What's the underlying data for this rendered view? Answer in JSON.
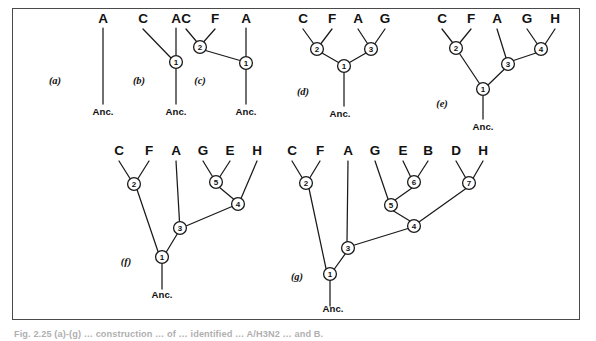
{
  "figure": {
    "kind": "phylogenetic-tree-series",
    "panel_count": 7,
    "frame_color": "#4a4a4a",
    "line_color": "#1a1a1a",
    "background": "#ffffff",
    "ancestor_label": "Anc."
  },
  "caption": {
    "text": "Fig. 2.25 (a)-(g) …  construction … of … identified … A/H3N2 … and B."
  },
  "panels": [
    {
      "id": "a",
      "label": "(a)",
      "label_x": 55,
      "label_y": 84,
      "anc": {
        "text": "Anc.",
        "x": 103,
        "y": 115
      },
      "taxa": [
        {
          "name": "A",
          "x": 103,
          "y": 23
        }
      ],
      "nodes": [],
      "branches": [
        {
          "x1": 103,
          "y1": 28,
          "x2": 103,
          "y2": 104
        }
      ]
    },
    {
      "id": "b",
      "label": "(b)",
      "label_x": 139,
      "label_y": 84,
      "anc": {
        "text": "Anc.",
        "x": 176,
        "y": 115
      },
      "taxa": [
        {
          "name": "C",
          "x": 143,
          "y": 23
        },
        {
          "name": "A",
          "x": 176,
          "y": 23
        }
      ],
      "nodes": [
        {
          "num": "1",
          "x": 176,
          "y": 62,
          "r": 6.4
        }
      ],
      "branches": [
        {
          "x1": 176,
          "y1": 28,
          "x2": 176,
          "y2": 55.6
        },
        {
          "x1": 143,
          "y1": 29,
          "x2": 171.5,
          "y2": 58.5
        },
        {
          "x1": 176,
          "y1": 68.4,
          "x2": 176,
          "y2": 104
        }
      ]
    },
    {
      "id": "c",
      "label": "(c)",
      "label_x": 200,
      "label_y": 84,
      "anc": {
        "text": "Anc.",
        "x": 246,
        "y": 115
      },
      "taxa": [
        {
          "name": "C",
          "x": 186,
          "y": 23
        },
        {
          "name": "F",
          "x": 215,
          "y": 23
        },
        {
          "name": "A",
          "x": 246,
          "y": 23
        }
      ],
      "nodes": [
        {
          "num": "2",
          "x": 200,
          "y": 47,
          "r": 6.4
        },
        {
          "num": "1",
          "x": 246,
          "y": 63,
          "r": 6.4
        }
      ],
      "branches": [
        {
          "x1": 186,
          "y1": 29,
          "x2": 196.5,
          "y2": 41.5
        },
        {
          "x1": 215,
          "y1": 29,
          "x2": 204,
          "y2": 41.5
        },
        {
          "x1": 205.5,
          "y1": 50.5,
          "x2": 240,
          "y2": 60.5
        },
        {
          "x1": 246,
          "y1": 28,
          "x2": 246,
          "y2": 56.6
        },
        {
          "x1": 246,
          "y1": 69.4,
          "x2": 246,
          "y2": 104
        }
      ]
    },
    {
      "id": "d",
      "label": "(d)",
      "label_x": 303,
      "label_y": 95,
      "anc": {
        "text": "Anc.",
        "x": 340,
        "y": 117
      },
      "taxa": [
        {
          "name": "C",
          "x": 303,
          "y": 23
        },
        {
          "name": "F",
          "x": 332,
          "y": 23
        },
        {
          "name": "A",
          "x": 358,
          "y": 23
        },
        {
          "name": "G",
          "x": 385,
          "y": 23
        }
      ],
      "nodes": [
        {
          "num": "2",
          "x": 317,
          "y": 49,
          "r": 6.4
        },
        {
          "num": "3",
          "x": 371,
          "y": 49,
          "r": 6.4
        },
        {
          "num": "1",
          "x": 344,
          "y": 66,
          "r": 6.4
        }
      ],
      "branches": [
        {
          "x1": 303,
          "y1": 29,
          "x2": 313.5,
          "y2": 43.5
        },
        {
          "x1": 332,
          "y1": 29,
          "x2": 321,
          "y2": 43.5
        },
        {
          "x1": 358,
          "y1": 29,
          "x2": 367.5,
          "y2": 43.5
        },
        {
          "x1": 385,
          "y1": 29,
          "x2": 375,
          "y2": 43.5
        },
        {
          "x1": 322,
          "y1": 53,
          "x2": 338.5,
          "y2": 62.5
        },
        {
          "x1": 366,
          "y1": 53,
          "x2": 349.5,
          "y2": 62.5
        },
        {
          "x1": 344,
          "y1": 72.4,
          "x2": 344,
          "y2": 106
        }
      ]
    },
    {
      "id": "e",
      "label": "(e)",
      "label_x": 442,
      "label_y": 107,
      "anc": {
        "text": "Anc.",
        "x": 483,
        "y": 130
      },
      "taxa": [
        {
          "name": "C",
          "x": 442,
          "y": 23
        },
        {
          "name": "F",
          "x": 471,
          "y": 23
        },
        {
          "name": "A",
          "x": 497,
          "y": 23
        },
        {
          "name": "G",
          "x": 527,
          "y": 23
        },
        {
          "name": "H",
          "x": 555,
          "y": 23
        }
      ],
      "nodes": [
        {
          "num": "2",
          "x": 456,
          "y": 48,
          "r": 6.4
        },
        {
          "num": "4",
          "x": 541,
          "y": 49,
          "r": 6.4
        },
        {
          "num": "3",
          "x": 508,
          "y": 64,
          "r": 6.4
        },
        {
          "num": "1",
          "x": 483,
          "y": 89,
          "r": 6.4
        }
      ],
      "branches": [
        {
          "x1": 442,
          "y1": 29,
          "x2": 452.5,
          "y2": 42.5
        },
        {
          "x1": 471,
          "y1": 29,
          "x2": 460,
          "y2": 42.5
        },
        {
          "x1": 527,
          "y1": 29,
          "x2": 537,
          "y2": 43.5
        },
        {
          "x1": 555,
          "y1": 29,
          "x2": 545.5,
          "y2": 43.5
        },
        {
          "x1": 497,
          "y1": 29,
          "x2": 506,
          "y2": 57.8
        },
        {
          "x1": 536,
          "y1": 53,
          "x2": 513.5,
          "y2": 60.5
        },
        {
          "x1": 504,
          "y1": 69.5,
          "x2": 488,
          "y2": 85
        },
        {
          "x1": 459.5,
          "y1": 53.5,
          "x2": 479.5,
          "y2": 83.5
        },
        {
          "x1": 483,
          "y1": 95.4,
          "x2": 483,
          "y2": 119
        }
      ]
    },
    {
      "id": "f",
      "label": "(f)",
      "label_x": 126,
      "label_y": 265,
      "anc": {
        "text": "Anc.",
        "x": 162,
        "y": 298
      },
      "taxa": [
        {
          "name": "C",
          "x": 119,
          "y": 155
        },
        {
          "name": "F",
          "x": 149,
          "y": 155
        },
        {
          "name": "A",
          "x": 176,
          "y": 155
        },
        {
          "name": "G",
          "x": 203,
          "y": 155
        },
        {
          "name": "E",
          "x": 230,
          "y": 155
        },
        {
          "name": "H",
          "x": 257,
          "y": 155
        }
      ],
      "nodes": [
        {
          "num": "2",
          "x": 134,
          "y": 184,
          "r": 6.4
        },
        {
          "num": "5",
          "x": 216,
          "y": 182,
          "r": 6.4
        },
        {
          "num": "4",
          "x": 238,
          "y": 204,
          "r": 6.4
        },
        {
          "num": "3",
          "x": 180,
          "y": 228,
          "r": 6.4
        },
        {
          "num": "1",
          "x": 162,
          "y": 257,
          "r": 6.4
        }
      ],
      "branches": [
        {
          "x1": 119,
          "y1": 161,
          "x2": 130,
          "y2": 178.5
        },
        {
          "x1": 149,
          "y1": 161,
          "x2": 138,
          "y2": 178.5
        },
        {
          "x1": 203,
          "y1": 161,
          "x2": 212.5,
          "y2": 176.5
        },
        {
          "x1": 230,
          "y1": 161,
          "x2": 220,
          "y2": 176.5
        },
        {
          "x1": 257,
          "y1": 161,
          "x2": 241,
          "y2": 198.5
        },
        {
          "x1": 176,
          "y1": 161,
          "x2": 179.5,
          "y2": 221.6
        },
        {
          "x1": 219,
          "y1": 187,
          "x2": 234,
          "y2": 199.5
        },
        {
          "x1": 232,
          "y1": 206.5,
          "x2": 186,
          "y2": 226
        },
        {
          "x1": 137,
          "y1": 189.5,
          "x2": 158,
          "y2": 251.5
        },
        {
          "x1": 177.5,
          "y1": 233.5,
          "x2": 166,
          "y2": 252.5
        },
        {
          "x1": 162,
          "y1": 263.4,
          "x2": 162,
          "y2": 289
        }
      ]
    },
    {
      "id": "g",
      "label": "(g)",
      "label_x": 297,
      "label_y": 280,
      "anc": {
        "text": "Anc.",
        "x": 333,
        "y": 312
      },
      "taxa": [
        {
          "name": "C",
          "x": 292,
          "y": 155
        },
        {
          "name": "F",
          "x": 320,
          "y": 155
        },
        {
          "name": "A",
          "x": 348,
          "y": 155
        },
        {
          "name": "G",
          "x": 375,
          "y": 155
        },
        {
          "name": "E",
          "x": 403,
          "y": 155
        },
        {
          "name": "B",
          "x": 428,
          "y": 155
        },
        {
          "name": "D",
          "x": 456,
          "y": 155
        },
        {
          "name": "H",
          "x": 483,
          "y": 155
        }
      ],
      "nodes": [
        {
          "num": "2",
          "x": 306,
          "y": 183,
          "r": 6.4
        },
        {
          "num": "6",
          "x": 414,
          "y": 182,
          "r": 6.4
        },
        {
          "num": "7",
          "x": 469,
          "y": 183,
          "r": 6.4
        },
        {
          "num": "5",
          "x": 391,
          "y": 205,
          "r": 6.4
        },
        {
          "num": "4",
          "x": 414,
          "y": 226,
          "r": 6.4
        },
        {
          "num": "3",
          "x": 348,
          "y": 248,
          "r": 6.4
        },
        {
          "num": "1",
          "x": 330,
          "y": 274,
          "r": 6.4
        }
      ],
      "branches": [
        {
          "x1": 292,
          "y1": 161,
          "x2": 302,
          "y2": 177.5
        },
        {
          "x1": 320,
          "y1": 161,
          "x2": 310,
          "y2": 177.5
        },
        {
          "x1": 403,
          "y1": 161,
          "x2": 410.5,
          "y2": 176.5
        },
        {
          "x1": 428,
          "y1": 161,
          "x2": 418,
          "y2": 176.5
        },
        {
          "x1": 456,
          "y1": 161,
          "x2": 465.5,
          "y2": 177.5
        },
        {
          "x1": 483,
          "y1": 161,
          "x2": 473.5,
          "y2": 177.5
        },
        {
          "x1": 375,
          "y1": 161,
          "x2": 388,
          "y2": 199
        },
        {
          "x1": 412,
          "y1": 188,
          "x2": 395,
          "y2": 200
        },
        {
          "x1": 393.5,
          "y1": 211,
          "x2": 410,
          "y2": 221
        },
        {
          "x1": 466,
          "y1": 188.5,
          "x2": 419,
          "y2": 222
        },
        {
          "x1": 408,
          "y1": 228.5,
          "x2": 354.5,
          "y2": 245
        },
        {
          "x1": 348,
          "y1": 161,
          "x2": 347,
          "y2": 241.6
        },
        {
          "x1": 345.5,
          "y1": 253.5,
          "x2": 334,
          "y2": 269.5
        },
        {
          "x1": 309,
          "y1": 188.5,
          "x2": 326,
          "y2": 268.5
        },
        {
          "x1": 330,
          "y1": 280.4,
          "x2": 330,
          "y2": 306
        }
      ]
    }
  ]
}
